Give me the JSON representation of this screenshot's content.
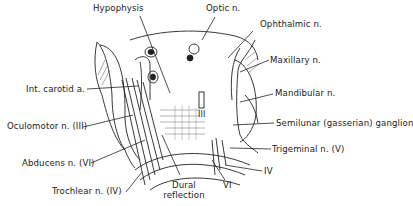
{
  "figure": {
    "labels": [
      {
        "id": "hypophysis",
        "text": "Hypophysis"
      },
      {
        "id": "optic",
        "text": "Optic n."
      },
      {
        "id": "ophthalmic",
        "text": "Ophthalmic n."
      },
      {
        "id": "maxillary",
        "text": "Maxillary n."
      },
      {
        "id": "int_carotid",
        "text": "Int. carotid a."
      },
      {
        "id": "mandibular",
        "text": "Mandibular n."
      },
      {
        "id": "oculomotor",
        "text": "Oculomotor n. (III)"
      },
      {
        "id": "semilunar",
        "text": "Semilunar (gasserian) ganglion"
      },
      {
        "id": "trigeminal",
        "text": "Trigeminal n. (V)"
      },
      {
        "id": "abducens",
        "text": "Abducens n. (VI)"
      },
      {
        "id": "iv_right",
        "text": "IV"
      },
      {
        "id": "trochlear",
        "text": "Trochlear n. (IV)"
      },
      {
        "id": "dural_1",
        "text": "Dural"
      },
      {
        "id": "dural_2",
        "text": "reflection"
      },
      {
        "id": "vi_right",
        "text": "VI"
      },
      {
        "id": "iii_inner",
        "text": "III"
      }
    ]
  }
}
